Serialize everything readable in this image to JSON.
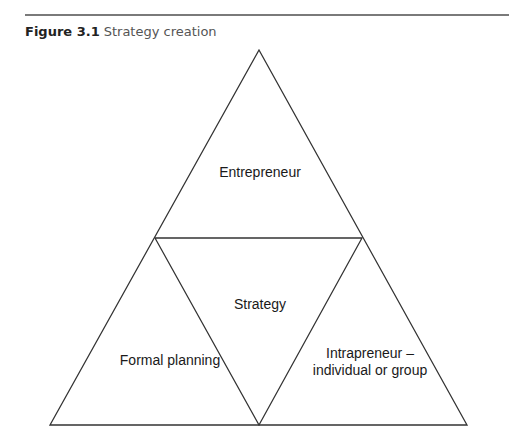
{
  "caption": {
    "number": "Figure 3.1",
    "title": "Strategy creation"
  },
  "diagram": {
    "regions": [
      {
        "id": "top",
        "label": "Entrepreneur"
      },
      {
        "id": "center",
        "label": "Strategy"
      },
      {
        "id": "left",
        "label": "Formal planning"
      },
      {
        "id": "right",
        "label_line1": "Intrapreneur –",
        "label_line2": "individual or group"
      }
    ],
    "line_color": "#333333"
  }
}
